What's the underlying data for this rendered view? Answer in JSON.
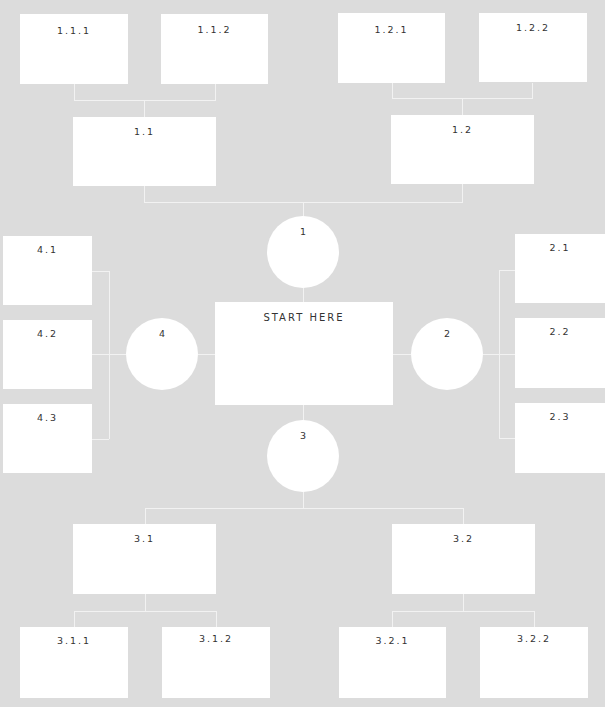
{
  "diagram": {
    "type": "mind-map",
    "background": "#dcdcdc",
    "node_color": "#ffffff",
    "center": {
      "label": "START HERE"
    },
    "hubs": [
      {
        "id": "1",
        "label": "1"
      },
      {
        "id": "2",
        "label": "2"
      },
      {
        "id": "3",
        "label": "3"
      },
      {
        "id": "4",
        "label": "4"
      }
    ],
    "nodes": {
      "n1_1": "1.1",
      "n1_2": "1.2",
      "n1_1_1": "1.1.1",
      "n1_1_2": "1.1.2",
      "n1_2_1": "1.2.1",
      "n1_2_2": "1.2.2",
      "n2_1": "2.1",
      "n2_2": "2.2",
      "n2_3": "2.3",
      "n3_1": "3.1",
      "n3_2": "3.2",
      "n3_1_1": "3.1.1",
      "n3_1_2": "3.1.2",
      "n3_2_1": "3.2.1",
      "n3_2_2": "3.2.2",
      "n4_1": "4.1",
      "n4_2": "4.2",
      "n4_3": "4.3"
    }
  }
}
